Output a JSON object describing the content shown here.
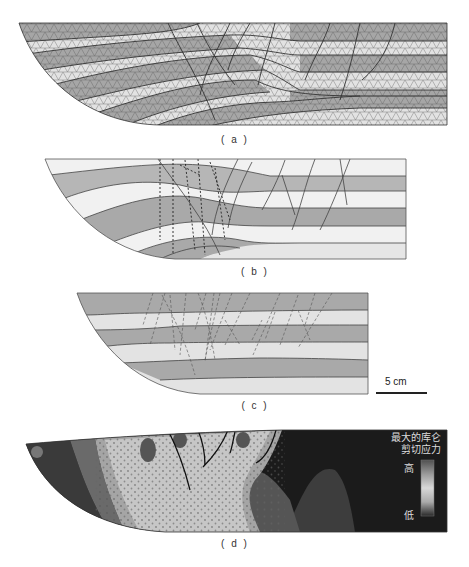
{
  "figure": {
    "panels": [
      {
        "id": "a",
        "caption": "( a )",
        "description": "finite-element triangular mesh of deformed layered sequence"
      },
      {
        "id": "b",
        "caption": "( b )",
        "description": "interpreted layers with faults (solid) and dashed fractures"
      },
      {
        "id": "c",
        "caption": "( c )",
        "description": "physical model layers with dashed fractures"
      },
      {
        "id": "d",
        "caption": "( d )",
        "description": "maximum Coulomb shear stress distribution"
      }
    ],
    "scale_bar": {
      "label": "5 cm"
    },
    "legend": {
      "title_line1": "最大的库仑",
      "title_line2": "剪切应力",
      "high": "高",
      "low": "低"
    }
  },
  "colors": {
    "dark_layer": "#a9a9a9",
    "light_layer": "#e4e4e4",
    "mesh_line": "#3a3a3a",
    "stress_low": "#1a1a1a",
    "stress_high": "#c8c8c8"
  }
}
